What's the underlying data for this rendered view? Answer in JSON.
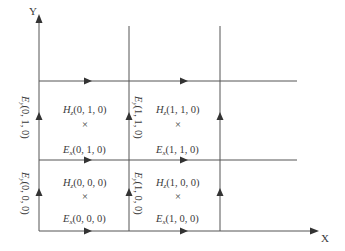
{
  "diagram": {
    "colors": {
      "line": "#555555",
      "text": "#3a3a3a",
      "background": "#ffffff"
    },
    "axes": {
      "x_label": "X",
      "y_label": "Y"
    },
    "cells": [
      {
        "id": "cell-0-1-0",
        "hz": {
          "sym": "H",
          "sub": "z",
          "coords": "(0, 1, 0)"
        },
        "mark": "×",
        "ex": {
          "sym": "E",
          "sub": "x",
          "coords": "(0, 1, 0)"
        },
        "ey": {
          "sym": "E",
          "sub": "y",
          "coords": "(0, 1, 0)"
        }
      },
      {
        "id": "cell-1-1-0",
        "hz": {
          "sym": "H",
          "sub": "z",
          "coords": "(1, 1, 0)"
        },
        "mark": "×",
        "ex": {
          "sym": "E",
          "sub": "x",
          "coords": "(1, 1, 0)"
        },
        "ey": {
          "sym": "E",
          "sub": "y",
          "coords": "(1, 1, 0)"
        }
      },
      {
        "id": "cell-0-0-0",
        "hz": {
          "sym": "H",
          "sub": "z",
          "coords": "(0, 0, 0)"
        },
        "mark": "×",
        "ex": {
          "sym": "E",
          "sub": "x",
          "coords": "(0, 0, 0)"
        },
        "ey": {
          "sym": "E",
          "sub": "y",
          "coords": "(0, 0, 0)"
        }
      },
      {
        "id": "cell-1-0-0",
        "hz": {
          "sym": "H",
          "sub": "z",
          "coords": "(1, 0, 0)"
        },
        "mark": "×",
        "ex": {
          "sym": "E",
          "sub": "x",
          "coords": "(1, 0, 0)"
        },
        "ey": {
          "sym": "E",
          "sub": "y",
          "coords": "(1, 0, 0)"
        }
      }
    ]
  }
}
